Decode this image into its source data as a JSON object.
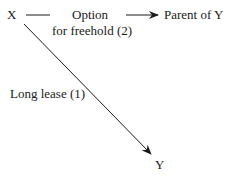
{
  "diagram": {
    "nodes": {
      "x": "X",
      "parent": "Parent of Y",
      "y": "Y"
    },
    "edges": {
      "option_line1": "Option",
      "option_line2": "for freehold (2)",
      "lease": "Long lease (1)"
    },
    "colors": {
      "ink": "#1a1a1a",
      "background": "#ffffff"
    }
  }
}
